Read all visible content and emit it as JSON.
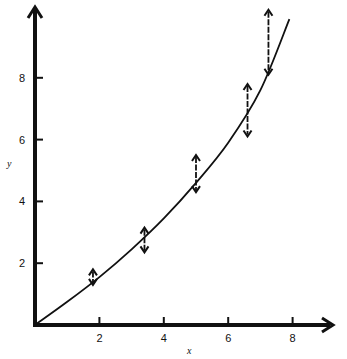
{
  "chart_data": {
    "type": "scatter",
    "title": "",
    "xlabel": "x",
    "ylabel": "y",
    "xlim": [
      0,
      9
    ],
    "ylim": [
      0,
      10
    ],
    "grid": false,
    "legend": null,
    "x_ticks": [
      2,
      4,
      6,
      8
    ],
    "y_ticks": [
      2,
      4,
      6,
      8
    ],
    "x_tick_labels": [
      "2",
      "4",
      "6",
      "8"
    ],
    "y_tick_labels": [
      "2",
      "4",
      "6",
      "8"
    ],
    "series": [
      {
        "name": "error bars",
        "style": "vertical double-headed arrows",
        "points": [
          {
            "x": 1.8,
            "y_low": 1.3,
            "y_high": 1.8
          },
          {
            "x": 3.4,
            "y_low": 2.35,
            "y_high": 3.15
          },
          {
            "x": 5.0,
            "y_low": 4.3,
            "y_high": 5.5
          },
          {
            "x": 6.6,
            "y_low": 6.1,
            "y_high": 7.8
          },
          {
            "x": 7.25,
            "y_low": 8.1,
            "y_high": 10.2
          }
        ]
      },
      {
        "name": "fitted curve",
        "style": "smooth line",
        "x": [
          0,
          1,
          2,
          3,
          4,
          5,
          6,
          7,
          7.9
        ],
        "y": [
          0,
          0.75,
          1.55,
          2.45,
          3.45,
          4.6,
          5.9,
          7.6,
          9.9
        ]
      }
    ]
  },
  "colors": {
    "ink": "#111111",
    "background": "#ffffff"
  }
}
